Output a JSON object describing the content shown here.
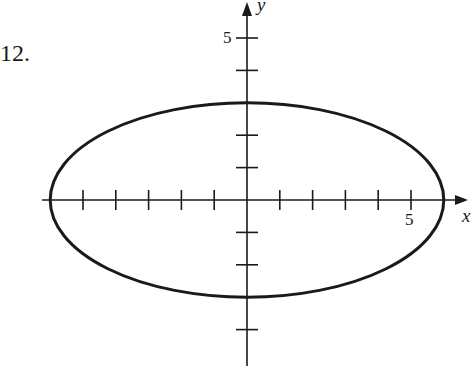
{
  "problem_number": "12.",
  "axes": {
    "x_label": "x",
    "y_label": "y",
    "x_tick_label": "5",
    "y_tick_label": "5",
    "x_range": [
      -6.2,
      6.5
    ],
    "y_range": [
      -4.8,
      6.0
    ],
    "tick_spacing": 1,
    "origin_px": [
      247,
      200
    ],
    "unit_px_x": 32.8,
    "unit_px_y": 32.4
  },
  "curve": {
    "type": "ellipse",
    "equation": "x^2/36 + y^2/9 = 1",
    "center": [
      0,
      0
    ],
    "semi_major_x": 6,
    "semi_minor_y": 3,
    "stroke": "#1a1a1a"
  },
  "colors": {
    "ink": "#1a1a1a",
    "background": "#ffffff"
  }
}
